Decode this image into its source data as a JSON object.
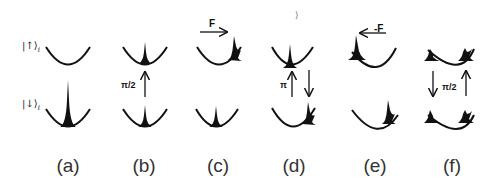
{
  "figure": {
    "state_labels": {
      "up": "|↑⟩",
      "down": "|↓⟩",
      "subscript": "i"
    },
    "panels": [
      {
        "id": "a",
        "label": "(a)",
        "cx": 68
      },
      {
        "id": "b",
        "label": "(b)",
        "cx": 145,
        "pulse": "π/2"
      },
      {
        "id": "c",
        "label": "(c)",
        "cx": 216,
        "force": "F"
      },
      {
        "id": "d",
        "label": "(d)",
        "cx": 291,
        "pulse": "π",
        "stray_mark": "⟩"
      },
      {
        "id": "e",
        "label": "(e)",
        "cx": 376,
        "force": "-F"
      },
      {
        "id": "f",
        "label": "(f)",
        "cx": 461,
        "pulse": "π/2"
      }
    ],
    "colors": {
      "ink": "#111111",
      "background": "#ffffff"
    }
  }
}
